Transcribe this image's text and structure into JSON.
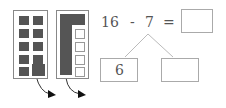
{
  "equation": {
    "minuend": "16",
    "operator": "-",
    "subtrahend": "7",
    "equals": "=",
    "answer": ""
  },
  "decomposition": {
    "left": "6",
    "right": ""
  },
  "frames": {
    "left": {
      "filled": 10,
      "description": "ten-frame with 10 filled squares, last one highlighted"
    },
    "right": {
      "filled": 6,
      "empty": 4,
      "description": "ten-frame with 6 filled, 4 empty"
    }
  },
  "colors": {
    "filled": "#555555",
    "border": "#888888"
  }
}
